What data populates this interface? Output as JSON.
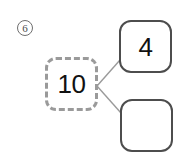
{
  "worksheet": {
    "problem_number": "6",
    "background_color": "#ffffff"
  },
  "number_bond": {
    "whole": {
      "label": "10",
      "border_style": "dashed",
      "border_color": "#9a9a9a"
    },
    "parts": [
      {
        "label": "4",
        "border_style": "solid",
        "border_color": "#4d4d4d",
        "filled": true
      },
      {
        "label": "",
        "border_style": "solid",
        "border_color": "#4d4d4d",
        "filled": false
      }
    ],
    "connector_color": "#9a9a9a"
  }
}
